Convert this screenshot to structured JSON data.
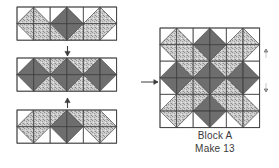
{
  "diagram": {
    "type": "quilt-block-piecing",
    "colors": {
      "background": "#ffffff",
      "dark_fabric": "#6e6e6e",
      "light_fabric": "#ffffff",
      "speckled_fabric": "#c9c9c9",
      "outline": "#3c3c3c",
      "arrow": "#3c3c3c",
      "text": "#3a3a3a"
    },
    "caption": {
      "line1": "Block A",
      "line2": "Make 13"
    },
    "arrows": [
      {
        "name": "arrow-top-to-middle",
        "direction": "down",
        "glyph": "↓"
      },
      {
        "name": "arrow-bottom-to-middle",
        "direction": "up",
        "glyph": "↑"
      },
      {
        "name": "arrow-strips-to-block",
        "direction": "right",
        "glyph": "→"
      },
      {
        "name": "arrow-block-edge-up",
        "direction": "up",
        "glyph": "↑"
      },
      {
        "name": "arrow-block-edge-down",
        "direction": "down",
        "glyph": "↓"
      }
    ],
    "units": [
      {
        "name": "top-strip",
        "label": "Top Row Strip",
        "grid": "6 x 2",
        "x": 17,
        "y": 7,
        "cell": 16.6,
        "cols": 6,
        "rows": 2,
        "role": "row-1"
      },
      {
        "name": "middle-strip",
        "label": "Center Row Strip",
        "grid": "6 x 2",
        "x": 17,
        "y": 58,
        "cell": 16.6,
        "cols": 6,
        "rows": 2,
        "role": "row-2"
      },
      {
        "name": "bottom-strip",
        "label": "Bottom Row Strip",
        "grid": "6 x 2",
        "x": 17,
        "y": 110,
        "cell": 16.6,
        "cols": 6,
        "rows": 2,
        "role": "row-3"
      },
      {
        "name": "assembled-block",
        "label": "Block A",
        "grid": "6 x 6",
        "x": 160,
        "y": 28,
        "cell": 16.6,
        "cols": 6,
        "rows": 6,
        "role": "finished-block"
      }
    ]
  },
  "chart_data": {
    "type": "diagram"
  }
}
